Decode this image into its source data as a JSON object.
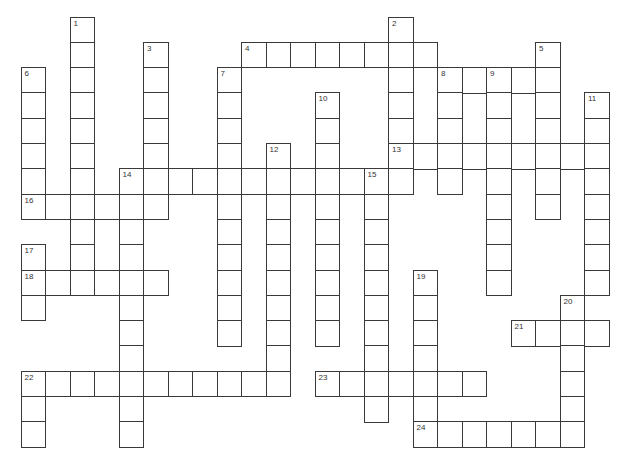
{
  "puzzle": {
    "origin": {
      "x": 20.5,
      "y": 16.5
    },
    "cell_w": 24.5,
    "cell_h": 25.3,
    "entries": [
      {
        "num": "1",
        "dir": "down",
        "row": 0,
        "col": 2,
        "len": 11
      },
      {
        "num": "2",
        "dir": "down",
        "row": 0,
        "col": 15,
        "len": 7
      },
      {
        "num": "3",
        "dir": "down",
        "row": 1,
        "col": 5,
        "len": 7
      },
      {
        "num": "4",
        "dir": "across",
        "row": 1,
        "col": 9,
        "len": 8
      },
      {
        "num": "5",
        "dir": "down",
        "row": 1,
        "col": 21,
        "len": 7
      },
      {
        "num": "6",
        "dir": "down",
        "row": 2,
        "col": 0,
        "len": 6
      },
      {
        "num": "7",
        "dir": "down",
        "row": 2,
        "col": 8,
        "len": 11
      },
      {
        "num": "8",
        "dir": "across",
        "row": 2,
        "col": 17,
        "len": 5
      },
      {
        "num": "8",
        "dir": "down",
        "row": 2,
        "col": 17,
        "len": 5
      },
      {
        "num": "9",
        "dir": "down",
        "row": 2,
        "col": 19,
        "len": 9
      },
      {
        "num": "10",
        "dir": "down",
        "row": 3,
        "col": 12,
        "len": 10
      },
      {
        "num": "11",
        "dir": "down",
        "row": 3,
        "col": 23,
        "len": 8
      },
      {
        "num": "12",
        "dir": "down",
        "row": 5,
        "col": 10,
        "len": 10
      },
      {
        "num": "13",
        "dir": "across",
        "row": 5,
        "col": 15,
        "len": 9
      },
      {
        "num": "14",
        "dir": "across",
        "row": 6,
        "col": 4,
        "len": 12
      },
      {
        "num": "14",
        "dir": "down",
        "row": 6,
        "col": 4,
        "len": 11
      },
      {
        "num": "15",
        "dir": "down",
        "row": 6,
        "col": 14,
        "len": 10
      },
      {
        "num": "16",
        "dir": "across",
        "row": 7,
        "col": 0,
        "len": 6
      },
      {
        "num": "17",
        "dir": "down",
        "row": 9,
        "col": 0,
        "len": 3
      },
      {
        "num": "18",
        "dir": "across",
        "row": 10,
        "col": 0,
        "len": 6
      },
      {
        "num": "19",
        "dir": "down",
        "row": 10,
        "col": 16,
        "len": 7
      },
      {
        "num": "20",
        "dir": "down",
        "row": 11,
        "col": 22,
        "len": 6
      },
      {
        "num": "21",
        "dir": "across",
        "row": 12,
        "col": 20,
        "len": 4
      },
      {
        "num": "22",
        "dir": "across",
        "row": 14,
        "col": 0,
        "len": 11
      },
      {
        "num": "22",
        "dir": "down",
        "row": 14,
        "col": 0,
        "len": 3
      },
      {
        "num": "23",
        "dir": "across",
        "row": 14,
        "col": 12,
        "len": 7
      },
      {
        "num": "24",
        "dir": "across",
        "row": 16,
        "col": 16,
        "len": 7
      }
    ],
    "clue_numbers": [
      "1",
      "2",
      "3",
      "4",
      "5",
      "6",
      "7",
      "8",
      "9",
      "10",
      "11",
      "12",
      "13",
      "14",
      "15",
      "16",
      "17",
      "18",
      "19",
      "20",
      "21",
      "22",
      "23",
      "24"
    ],
    "colors": {
      "border": "#3a3a3a",
      "cell_bg": "#ffffff",
      "number": "#333333"
    }
  }
}
